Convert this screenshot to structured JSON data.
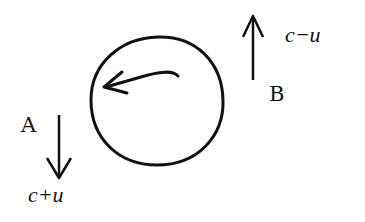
{
  "diagram": {
    "circle": {
      "rotation_arrow_direction": "counterclockwise"
    },
    "arrow_a": {
      "label": "A",
      "direction": "down",
      "speed_label": "c+u"
    },
    "arrow_b": {
      "label": "B",
      "direction": "up",
      "speed_label": "c−u"
    },
    "colors": {
      "ink": "#111111",
      "background": "#ffffff"
    }
  }
}
